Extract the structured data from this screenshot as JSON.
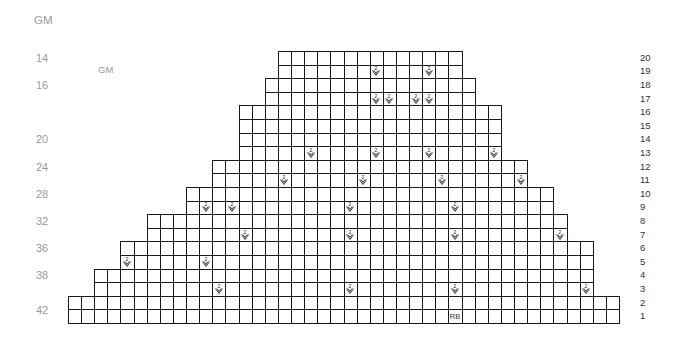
{
  "top_label": "GM",
  "inner_label": "GM",
  "stitch_counts": [
    {
      "label": "14",
      "row": 19
    },
    {
      "label": "16",
      "row": 17
    },
    {
      "label": "20",
      "row": 13
    },
    {
      "label": "24",
      "row": 11
    },
    {
      "label": "28",
      "row": 9
    },
    {
      "label": "32",
      "row": 7
    },
    {
      "label": "36",
      "row": 5
    },
    {
      "label": "38",
      "row": 3
    },
    {
      "label": "42",
      "row": 1
    }
  ],
  "row_numbers": [
    "20",
    "19",
    "18",
    "17",
    "16",
    "15",
    "14",
    "13",
    "12",
    "11",
    "10",
    "9",
    "8",
    "7",
    "6",
    "5",
    "4",
    "3",
    "2",
    "1"
  ],
  "grid": {
    "origin_x": 68,
    "bottom_y": 323,
    "cell_w": 13.12,
    "cell_h": 13.6,
    "rows": [
      {
        "row": 1,
        "start": 0,
        "end": 42
      },
      {
        "row": 2,
        "start": 0,
        "end": 42
      },
      {
        "row": 3,
        "start": 2,
        "end": 40
      },
      {
        "row": 4,
        "start": 2,
        "end": 40
      },
      {
        "row": 5,
        "start": 4,
        "end": 40
      },
      {
        "row": 6,
        "start": 4,
        "end": 40
      },
      {
        "row": 7,
        "start": 6,
        "end": 38
      },
      {
        "row": 8,
        "start": 6,
        "end": 38
      },
      {
        "row": 9,
        "start": 9,
        "end": 37
      },
      {
        "row": 10,
        "start": 9,
        "end": 37
      },
      {
        "row": 11,
        "start": 11,
        "end": 35
      },
      {
        "row": 12,
        "start": 11,
        "end": 35
      },
      {
        "row": 13,
        "start": 13,
        "end": 33
      },
      {
        "row": 14,
        "start": 13,
        "end": 33
      },
      {
        "row": 15,
        "start": 13,
        "end": 33
      },
      {
        "row": 16,
        "start": 13,
        "end": 33
      },
      {
        "row": 17,
        "start": 15,
        "end": 31
      },
      {
        "row": 18,
        "start": 15,
        "end": 31
      },
      {
        "row": 19,
        "start": 16,
        "end": 30
      },
      {
        "row": 20,
        "start": 16,
        "end": 30
      }
    ],
    "decreases": [
      {
        "row": 19,
        "cols": [
          23,
          27
        ]
      },
      {
        "row": 17,
        "cols": [
          23,
          24,
          26,
          27
        ]
      },
      {
        "row": 13,
        "cols": [
          18,
          23,
          27,
          32
        ]
      },
      {
        "row": 11,
        "cols": [
          16,
          22,
          28,
          34
        ]
      },
      {
        "row": 9,
        "cols": [
          10,
          12,
          21,
          29
        ]
      },
      {
        "row": 7,
        "cols": [
          13,
          21,
          29,
          37
        ]
      },
      {
        "row": 5,
        "cols": [
          4,
          10
        ]
      },
      {
        "row": 3,
        "cols": [
          11,
          21,
          29,
          39
        ]
      }
    ],
    "decrease_symbol": "2-stitch decrease",
    "markers": [
      {
        "row": 1,
        "col": 29,
        "text": "RB"
      }
    ]
  }
}
